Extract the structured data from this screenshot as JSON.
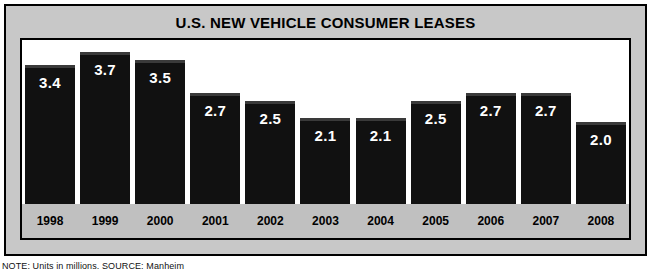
{
  "figure": {
    "title": "U.S. NEW VEHICLE CONSUMER LEASES",
    "footnote": "NOTE: Units in millions. SOURCE: Manheim",
    "colors": {
      "bar": "#111111",
      "bar_top_highlight": "#3a3a3a",
      "frame": "#c8c8c8",
      "axis_band": "#c0c0c0",
      "plot_background": "#ffffff",
      "border": "#000000",
      "value_label": "#ffffff"
    }
  },
  "chart_data": {
    "type": "bar",
    "title": "U.S. NEW VEHICLE CONSUMER LEASES",
    "xlabel": "",
    "ylabel": "",
    "units": "millions",
    "source": "Manheim",
    "grid": false,
    "legend": null,
    "ylim": [
      0,
      4.0
    ],
    "categories": [
      "1998",
      "1999",
      "2000",
      "2001",
      "2002",
      "2003",
      "2004",
      "2005",
      "2006",
      "2007",
      "2008"
    ],
    "values": [
      3.4,
      3.7,
      3.5,
      2.7,
      2.5,
      2.1,
      2.1,
      2.5,
      2.7,
      2.7,
      2.0
    ],
    "value_labels": [
      "3.4",
      "3.7",
      "3.5",
      "2.7",
      "2.5",
      "2.1",
      "2.1",
      "2.5",
      "2.7",
      "2.7",
      "2.0"
    ]
  }
}
